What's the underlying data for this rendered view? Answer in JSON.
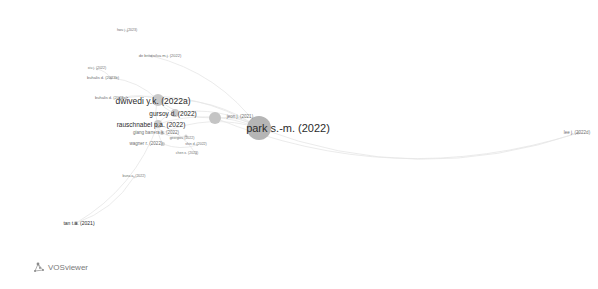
{
  "app": {
    "name": "VOSviewer",
    "logo_text": "VOSviewer"
  },
  "visualization": {
    "type": "network",
    "edge_color": "#e6e6e6",
    "node_color": "#bdbdbd",
    "nodes": [
      {
        "id": "park_sm_2022",
        "label": "park s.-m. (2022)",
        "x": 259,
        "y": 128,
        "r": 12,
        "font": 11,
        "lx": 288,
        "ly": 128,
        "color": "#b5b5b5"
      },
      {
        "id": "dwivedi_yk_2022a",
        "label": "dwivedi y.k. (2022a)",
        "x": 158,
        "y": 100,
        "r": 6,
        "font": 8.5,
        "lx": 153,
        "ly": 101,
        "color": "#c8c8c8"
      },
      {
        "id": "jeon_j_2021",
        "label": "jeon j. (2021)",
        "x": 215,
        "y": 118,
        "r": 6,
        "font": 4.5,
        "lx": 240,
        "ly": 117,
        "color": "#c4c4c4"
      },
      {
        "id": "gursoy_d_2022",
        "label": "gursoy d. (2022)",
        "x": 175,
        "y": 113,
        "r": 4,
        "font": 6.5,
        "lx": 173,
        "ly": 114,
        "color": "#c9c9c9"
      },
      {
        "id": "rauschnabel_pa_2022",
        "label": "rauschnabel p.a. (2022)",
        "x": 158,
        "y": 124,
        "r": 4,
        "font": 6.5,
        "lx": 151,
        "ly": 125,
        "color": "#c9c9c9"
      },
      {
        "id": "giang_barrera_k_2022",
        "label": "giang barrera k. (2022)",
        "x": 162,
        "y": 133,
        "r": 2,
        "font": 4.5,
        "lx": 156,
        "ly": 133,
        "color": "#cfcfcf"
      },
      {
        "id": "buhalis_d_2023a",
        "label": "buhalis d. (2023a)",
        "x": 122,
        "y": 98,
        "r": 1.5,
        "font": 4,
        "lx": 111,
        "ly": 98,
        "color": "#d0d0d0"
      },
      {
        "id": "georgiou_2022",
        "label": "georgiou (2022)",
        "x": 186,
        "y": 136,
        "r": 1.5,
        "font": 3.5,
        "lx": 182,
        "ly": 139,
        "color": "#d2d2d2"
      },
      {
        "id": "wagner_2022",
        "label": "wagner r. (2022)",
        "x": 163,
        "y": 144,
        "r": 2,
        "font": 4.5,
        "lx": 146,
        "ly": 144,
        "color": "#cfcfcf"
      },
      {
        "id": "shin_d_2022",
        "label": "shin d. (2022)",
        "x": 197,
        "y": 145,
        "r": 1,
        "font": 3.5,
        "lx": 196,
        "ly": 145,
        "color": "#d6d6d6"
      },
      {
        "id": "chen_x_2023",
        "label": "chen x. (2023)",
        "x": 196,
        "y": 154,
        "r": 1,
        "font": 3.5,
        "lx": 187,
        "ly": 154,
        "color": "#d6d6d6"
      },
      {
        "id": "de_brito_silva_mj_2022",
        "label": "de brito silva m.j. (2022)",
        "x": 152,
        "y": 56,
        "r": 1.5,
        "font": 4,
        "lx": 160,
        "ly": 56,
        "color": "#d0d0d0"
      },
      {
        "id": "buhalis_d_2023b",
        "label": "buhalis d. (2023b)",
        "x": 111,
        "y": 78,
        "r": 1.5,
        "font": 4,
        "lx": 103,
        "ly": 78,
        "color": "#d0d0d0"
      },
      {
        "id": "xiu_j_2022",
        "label": "xiu j. (2022)",
        "x": 97,
        "y": 69,
        "r": 0.8,
        "font": 3.5,
        "lx": 97,
        "ly": 69,
        "color": "#d8d8d8"
      },
      {
        "id": "hwu_j_2023",
        "label": "hwu j. (2023)",
        "x": 127,
        "y": 31,
        "r": 0.8,
        "font": 3.5,
        "lx": 127,
        "ly": 31,
        "color": "#d8d8d8"
      },
      {
        "id": "lee_j_2022d",
        "label": "lee j. (2022d)",
        "x": 578,
        "y": 133,
        "r": 1.5,
        "font": 4.5,
        "lx": 577,
        "ly": 133,
        "color": "#d0d0d0"
      },
      {
        "id": "tan_ta_2021",
        "label": "tan t.a. (2021)",
        "x": 76,
        "y": 223,
        "r": 2,
        "font": 5,
        "lx": 79,
        "ly": 223,
        "color": "#cdcdcd"
      },
      {
        "id": "buna_a_2022",
        "label": "buna a. (2022)",
        "x": 134,
        "y": 177,
        "r": 0.8,
        "font": 3.5,
        "lx": 134,
        "ly": 177,
        "color": "#d8d8d8"
      }
    ],
    "edges": [
      [
        "park_sm_2022",
        "dwivedi_yk_2022a"
      ],
      [
        "park_sm_2022",
        "gursoy_d_2022"
      ],
      [
        "park_sm_2022",
        "rauschnabel_pa_2022"
      ],
      [
        "park_sm_2022",
        "jeon_j_2021"
      ],
      [
        "park_sm_2022",
        "lee_j_2022d"
      ],
      [
        "park_sm_2022",
        "buhalis_d_2023a"
      ],
      [
        "park_sm_2022",
        "giang_barrera_k_2022"
      ],
      [
        "park_sm_2022",
        "de_brito_silva_mj_2022"
      ],
      [
        "dwivedi_yk_2022a",
        "gursoy_d_2022"
      ],
      [
        "dwivedi_yk_2022a",
        "rauschnabel_pa_2022"
      ],
      [
        "dwivedi_yk_2022a",
        "buhalis_d_2023a"
      ],
      [
        "dwivedi_yk_2022a",
        "buhalis_d_2023b"
      ],
      [
        "dwivedi_yk_2022a",
        "jeon_j_2021"
      ],
      [
        "gursoy_d_2022",
        "rauschnabel_pa_2022"
      ],
      [
        "rauschnabel_pa_2022",
        "wagner_2022"
      ],
      [
        "rauschnabel_pa_2022",
        "giang_barrera_k_2022"
      ],
      [
        "giang_barrera_k_2022",
        "georgiou_2022"
      ],
      [
        "wagner_2022",
        "shin_d_2022"
      ],
      [
        "buhalis_d_2023b",
        "xiu_j_2022"
      ],
      [
        "tan_ta_2021",
        "rauschnabel_pa_2022"
      ],
      [
        "tan_ta_2021",
        "buna_a_2022"
      ],
      [
        "chen_x_2023",
        "rauschnabel_pa_2022"
      ],
      [
        "jeon_j_2021",
        "lee_j_2022d"
      ]
    ]
  }
}
